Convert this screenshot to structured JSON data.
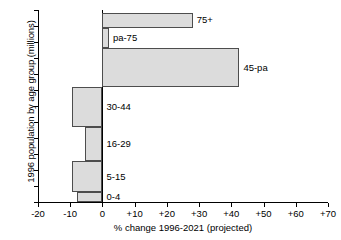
{
  "chart_data": {
    "type": "bar",
    "orientation": "horizontal",
    "title": "",
    "xlabel": "% change 1996-2021 (projected)",
    "ylabel": "1996 population by age group (millions)",
    "xlim": [
      -20,
      70
    ],
    "ylim": [
      0,
      60
    ],
    "xticks": [
      "-20",
      "-10",
      "0",
      "+10",
      "+20",
      "+30",
      "+40",
      "+50",
      "+60",
      "+70"
    ],
    "xtick_values": [
      -20,
      -10,
      0,
      10,
      20,
      30,
      40,
      50,
      60,
      70
    ],
    "yticks": [
      "0",
      "5",
      "10",
      "15",
      "20",
      "25",
      "30",
      "35",
      "40",
      "45",
      "50",
      "55",
      "60"
    ],
    "ytick_values": [
      0,
      5,
      10,
      15,
      20,
      25,
      30,
      35,
      40,
      45,
      50,
      55,
      60
    ],
    "grid": false,
    "legend": "none",
    "bar_fill_color": "#dcdcdc",
    "bar_edge_color": "#4d4d4d",
    "categories": [
      "0-4",
      "5-15",
      "16-29",
      "30-44",
      "45-pa",
      "pa-75",
      "75+"
    ],
    "values": [
      -8,
      -9.5,
      -5.5,
      -9.5,
      42.5,
      2,
      28
    ],
    "pop_start": [
      0,
      3,
      12.8,
      23.5,
      36,
      48,
      54.5
    ],
    "pop_end": [
      3,
      12.8,
      23.5,
      36,
      48,
      54.5,
      59.2
    ],
    "bars": [
      {
        "label": "0-4",
        "change_percent": -8,
        "pop_from": 0,
        "pop_to": 3,
        "label_side": "right"
      },
      {
        "label": "5-15",
        "change_percent": -9.5,
        "pop_from": 3,
        "pop_to": 12.8,
        "label_side": "right"
      },
      {
        "label": "16-29",
        "change_percent": -5.5,
        "pop_from": 12.8,
        "pop_to": 23.5,
        "label_side": "right"
      },
      {
        "label": "30-44",
        "change_percent": -9.5,
        "pop_from": 23.5,
        "pop_to": 36,
        "label_side": "right"
      },
      {
        "label": "45-pa",
        "change_percent": 42.5,
        "pop_from": 36,
        "pop_to": 48,
        "label_side": "right"
      },
      {
        "label": "pa-75",
        "change_percent": 2,
        "pop_from": 48,
        "pop_to": 54.5,
        "label_side": "right"
      },
      {
        "label": "75+",
        "change_percent": 28,
        "pop_from": 54.5,
        "pop_to": 59.2,
        "label_side": "right"
      }
    ]
  }
}
